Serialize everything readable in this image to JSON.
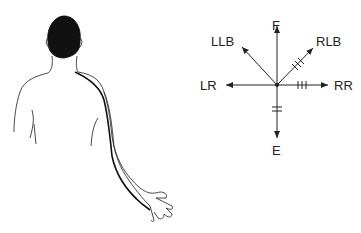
{
  "figure": {
    "type": "anatomical-vector-diagram",
    "left_panel": "posterior view of person with line traced along right shoulder and arm to hand",
    "vector_diagram": {
      "center": [
        277,
        85
      ],
      "labels": {
        "F": "F",
        "LLB": "LLB",
        "RLB": "RLB",
        "LR": "LR",
        "RR": "RR",
        "E": "E"
      },
      "tick_marks": {
        "RLB": 3,
        "RR": 3,
        "E": 2
      }
    },
    "colors": {
      "ink": "#222222",
      "hair": "#111111",
      "background": "#ffffff"
    }
  }
}
